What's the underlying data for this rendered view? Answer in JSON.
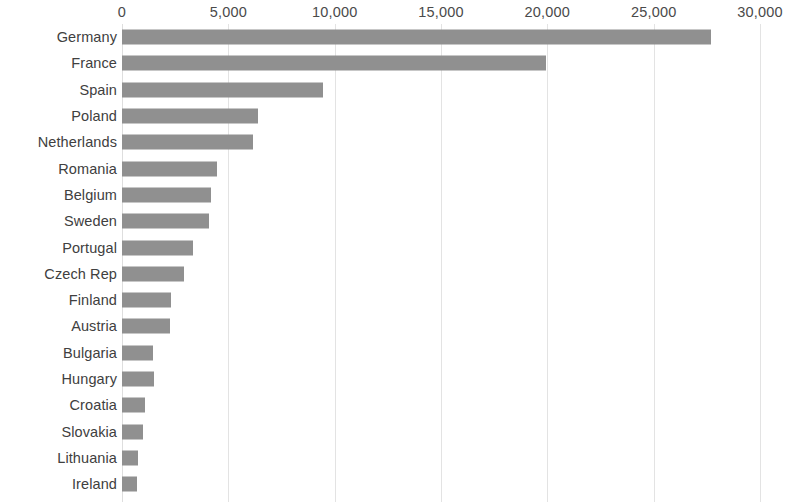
{
  "chart_data": {
    "type": "bar",
    "orientation": "horizontal",
    "title": "",
    "subtitle": "",
    "xlabel": "",
    "ylabel": "",
    "xlim": [
      0,
      30000
    ],
    "grid": true,
    "legend": null,
    "bar_color": "#909090",
    "gridline_color": "#e3e3e3",
    "axis_position": "top",
    "tick_labels": [
      "0",
      "5,000",
      "10,000",
      "15,000",
      "20,000",
      "25,000",
      "30,000"
    ],
    "tick_values": [
      0,
      5000,
      10000,
      15000,
      20000,
      25000,
      30000
    ],
    "categories": [
      "Germany",
      "France",
      "Spain",
      "Poland",
      "Netherlands",
      "Romania",
      "Belgium",
      "Sweden",
      "Portugal",
      "Czech Rep",
      "Finland",
      "Austria",
      "Bulgaria",
      "Hungary",
      "Croatia",
      "Slovakia",
      "Lithuania",
      "Ireland"
    ],
    "values": [
      27700,
      19950,
      9450,
      6400,
      6150,
      4450,
      4200,
      4100,
      3350,
      2900,
      2300,
      2250,
      1450,
      1500,
      1100,
      1000,
      750,
      700
    ]
  }
}
